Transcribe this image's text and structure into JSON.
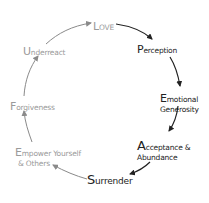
{
  "diagram": {
    "type": "cycle",
    "colors": {
      "dark": "#222222",
      "light": "#9a9a9a",
      "background": "#ffffff"
    },
    "nodes": [
      {
        "id": "love",
        "cap": "L",
        "rest": "OVE",
        "line2": "",
        "tone": "light"
      },
      {
        "id": "perception",
        "cap": "P",
        "rest": "erception",
        "line2": "",
        "tone": "dark"
      },
      {
        "id": "emotional-generosity",
        "cap": "E",
        "rest": "motional",
        "line2": "Generosity",
        "tone": "dark"
      },
      {
        "id": "acceptance-abundance",
        "cap": "A",
        "rest": "cceptance &",
        "line2": "Abundance",
        "tone": "dark"
      },
      {
        "id": "surrender",
        "cap": "S",
        "rest": "urrender",
        "line2": "",
        "tone": "dark"
      },
      {
        "id": "empower",
        "cap": "E",
        "rest": "mpower Yourself",
        "line2": "& Others",
        "tone": "light"
      },
      {
        "id": "forgiveness",
        "cap": "F",
        "rest": "orgiveness",
        "line2": "",
        "tone": "light"
      },
      {
        "id": "underreact",
        "cap": "U",
        "rest": "nderreact",
        "line2": "",
        "tone": "light"
      }
    ],
    "edges": [
      {
        "from": "love",
        "to": "perception"
      },
      {
        "from": "perception",
        "to": "emotional-generosity"
      },
      {
        "from": "emotional-generosity",
        "to": "acceptance-abundance"
      },
      {
        "from": "acceptance-abundance",
        "to": "surrender"
      },
      {
        "from": "surrender",
        "to": "empower"
      },
      {
        "from": "empower",
        "to": "forgiveness"
      },
      {
        "from": "forgiveness",
        "to": "underreact"
      },
      {
        "from": "underreact",
        "to": "love"
      }
    ]
  }
}
